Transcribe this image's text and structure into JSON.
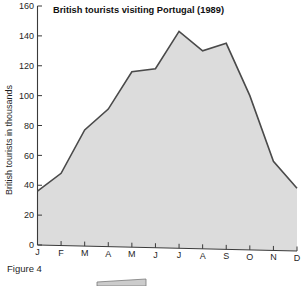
{
  "figure": {
    "caption": "Figure 4"
  },
  "chart_data": {
    "type": "area",
    "title": "British tourists visiting Portugal (1989)",
    "xlabel": "",
    "ylabel": "British tourists in thousands",
    "categories": [
      "J",
      "F",
      "M",
      "A",
      "M",
      "J",
      "J",
      "A",
      "S",
      "O",
      "N",
      "D"
    ],
    "month_names": [
      "January",
      "February",
      "March",
      "April",
      "May",
      "June",
      "July",
      "August",
      "September",
      "October",
      "November",
      "December"
    ],
    "values": [
      36,
      48,
      77,
      91,
      116,
      118,
      143,
      130,
      135,
      100,
      56,
      38
    ],
    "ylim": [
      0,
      160
    ],
    "yticks": [
      0,
      20,
      40,
      60,
      80,
      100,
      120,
      140,
      160
    ],
    "ytick_labels": [
      "0",
      "20",
      "40",
      "60",
      "80",
      "100",
      "120",
      "140",
      "160"
    ],
    "grid": false,
    "legend": "none",
    "fill_color": "#d9d9d9",
    "line_color": "#4a4a4a",
    "axis_color": "#3a3a3a"
  }
}
